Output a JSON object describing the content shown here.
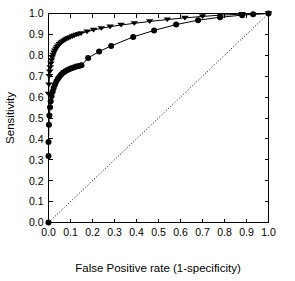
{
  "chart_data": {
    "type": "line",
    "title": "",
    "xlabel": "False Positive rate (1-specificity)",
    "ylabel": "Sensitivity",
    "xlim": [
      0.0,
      1.0
    ],
    "ylim": [
      0.0,
      1.0
    ],
    "grid": false,
    "legend": "none",
    "xticks": [
      "0.0",
      "0.1",
      "0.2",
      "0.3",
      "0.4",
      "0.5",
      "0.6",
      "0.7",
      "0.8",
      "0.9",
      "1.0"
    ],
    "yticks": [
      "0.0",
      "0.1",
      "0.2",
      "0.3",
      "0.4",
      "0.5",
      "0.6",
      "0.7",
      "0.8",
      "0.9",
      "1.0"
    ],
    "xtick_values": [
      0.0,
      0.1,
      0.2,
      0.3,
      0.4,
      0.5,
      0.6,
      0.7,
      0.8,
      0.9,
      1.0
    ],
    "ytick_values": [
      0.0,
      0.1,
      0.2,
      0.3,
      0.4,
      0.5,
      0.6,
      0.7,
      0.8,
      0.9,
      1.0
    ],
    "series": [
      {
        "name": "upper-roc-curve",
        "marker": "triangle-down",
        "marker_size": 2.6,
        "color": "#000000",
        "points": [
          [
            0.0,
            0.615
          ],
          [
            0.002,
            0.66
          ],
          [
            0.004,
            0.7
          ],
          [
            0.006,
            0.722
          ],
          [
            0.008,
            0.742
          ],
          [
            0.011,
            0.76
          ],
          [
            0.014,
            0.776
          ],
          [
            0.017,
            0.79
          ],
          [
            0.021,
            0.802
          ],
          [
            0.025,
            0.813
          ],
          [
            0.029,
            0.822
          ],
          [
            0.034,
            0.831
          ],
          [
            0.039,
            0.839
          ],
          [
            0.044,
            0.846
          ],
          [
            0.05,
            0.853
          ],
          [
            0.056,
            0.859
          ],
          [
            0.062,
            0.864
          ],
          [
            0.069,
            0.869
          ],
          [
            0.076,
            0.874
          ],
          [
            0.083,
            0.878
          ],
          [
            0.091,
            0.882
          ],
          [
            0.099,
            0.886
          ],
          [
            0.108,
            0.89
          ],
          [
            0.117,
            0.894
          ],
          [
            0.127,
            0.898
          ],
          [
            0.137,
            0.901
          ],
          [
            0.148,
            0.905
          ],
          [
            0.175,
            0.913
          ],
          [
            0.205,
            0.921
          ],
          [
            0.24,
            0.929
          ],
          [
            0.28,
            0.937
          ],
          [
            0.33,
            0.945
          ],
          [
            0.39,
            0.953
          ],
          [
            0.46,
            0.962
          ],
          [
            0.54,
            0.971
          ],
          [
            0.62,
            0.979
          ],
          [
            0.7,
            0.986
          ],
          [
            0.78,
            0.992
          ],
          [
            0.88,
            0.997
          ],
          [
            1.0,
            1.0
          ]
        ]
      },
      {
        "name": "lower-roc-curve",
        "marker": "circle",
        "marker_size": 3.0,
        "color": "#000000",
        "points": [
          [
            0.0,
            0.318
          ],
          [
            0.0,
            0.385
          ],
          [
            0.002,
            0.468
          ],
          [
            0.004,
            0.512
          ],
          [
            0.007,
            0.552
          ],
          [
            0.01,
            0.58
          ],
          [
            0.014,
            0.605
          ],
          [
            0.019,
            0.627
          ],
          [
            0.024,
            0.645
          ],
          [
            0.03,
            0.662
          ],
          [
            0.036,
            0.676
          ],
          [
            0.043,
            0.688
          ],
          [
            0.05,
            0.699
          ],
          [
            0.058,
            0.708
          ],
          [
            0.066,
            0.716
          ],
          [
            0.075,
            0.722
          ],
          [
            0.084,
            0.728
          ],
          [
            0.094,
            0.733
          ],
          [
            0.104,
            0.738
          ],
          [
            0.115,
            0.742
          ],
          [
            0.126,
            0.746
          ],
          [
            0.138,
            0.749
          ],
          [
            0.15,
            0.752
          ],
          [
            0.18,
            0.787
          ],
          [
            0.23,
            0.818
          ],
          [
            0.285,
            0.845
          ],
          [
            0.385,
            0.888
          ],
          [
            0.48,
            0.919
          ],
          [
            0.58,
            0.947
          ],
          [
            0.68,
            0.968
          ],
          [
            0.78,
            0.982
          ],
          [
            0.88,
            0.992
          ],
          [
            0.93,
            0.996
          ],
          [
            1.0,
            1.0
          ]
        ]
      },
      {
        "name": "reference-diagonal",
        "marker": "none",
        "style": "dotted",
        "color": "#000000",
        "points": [
          [
            0.0,
            0.0
          ],
          [
            1.0,
            1.0
          ]
        ]
      }
    ],
    "origin_marker": {
      "name": "origin-point",
      "x": 0.0,
      "y": 0.0,
      "marker": "circle"
    }
  }
}
